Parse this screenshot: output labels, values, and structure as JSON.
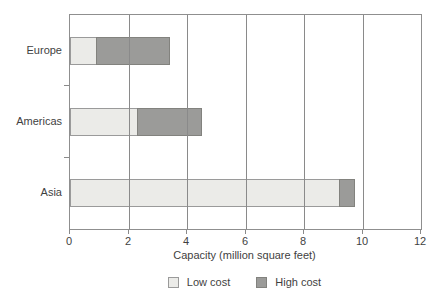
{
  "chart_data": {
    "type": "bar",
    "orientation": "horizontal",
    "stacked": true,
    "title": "",
    "categories": [
      "Europe",
      "Americas",
      "Asia"
    ],
    "series": [
      {
        "name": "Low cost",
        "values": [
          0.9,
          2.3,
          9.2
        ],
        "color": "#ebebe8",
        "border": "#9a9a9a"
      },
      {
        "name": "High cost",
        "values": [
          2.5,
          2.2,
          0.5
        ],
        "color": "#9b9b99",
        "border": "#82827e"
      }
    ],
    "xlabel": "Capacity (million square feet)",
    "ylabel": "",
    "xlim": [
      0,
      12
    ],
    "xticks": [
      0,
      2,
      4,
      6,
      8,
      10,
      12
    ],
    "grid": "vertical",
    "legend_position": "bottom"
  },
  "colors": {
    "background": "#ffffff",
    "axis": "#8f8f8f",
    "gridline": "#8a8a8a",
    "text": "#3f3f3f"
  }
}
